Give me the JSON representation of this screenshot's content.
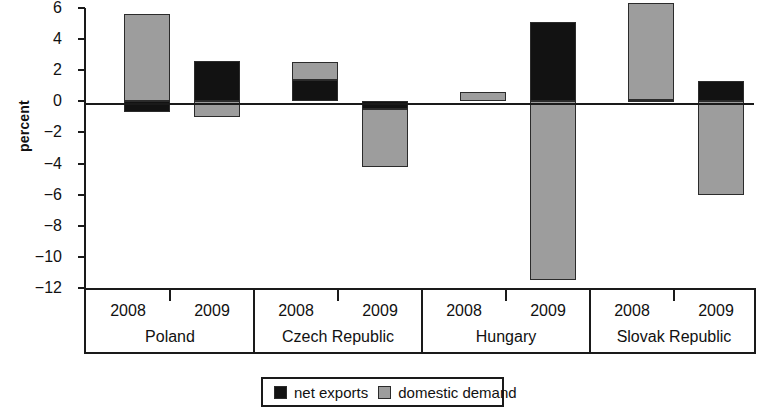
{
  "chart_data": {
    "type": "bar",
    "title": "",
    "subtitle": "",
    "xlabel": "",
    "ylabel": "percent",
    "stacked": true,
    "grid": false,
    "legend_position": "bottom",
    "ylim": [
      -12,
      6
    ],
    "yticks": [
      6,
      4,
      2,
      0,
      -2,
      -4,
      -6,
      -8,
      -10,
      -12
    ],
    "ytick_labels": [
      "6",
      "4",
      "2",
      "0",
      "−2",
      "−4",
      "−6",
      "−8",
      "−10",
      "−12"
    ],
    "groups": [
      "Poland",
      "Czech Republic",
      "Hungary",
      "Slovak Republic"
    ],
    "x": [
      "2008",
      "2009",
      "2008",
      "2009",
      "2008",
      "2009",
      "2008",
      "2009"
    ],
    "series": [
      {
        "name": "net exports",
        "color": "#121212",
        "values": [
          -0.7,
          2.6,
          1.4,
          -0.5,
          0.0,
          5.1,
          0.1,
          1.3
        ]
      },
      {
        "name": "domestic demand",
        "color": "#9d9d9d",
        "values": [
          5.6,
          -1.0,
          1.1,
          -3.7,
          0.6,
          -11.5,
          6.2,
          -6.0
        ]
      }
    ],
    "points": [
      {
        "group": "Poland",
        "year": "2008",
        "net_exports": -0.7,
        "domestic_demand": 5.6
      },
      {
        "group": "Poland",
        "year": "2009",
        "net_exports": 2.6,
        "domestic_demand": -1.0
      },
      {
        "group": "Czech Republic",
        "year": "2008",
        "net_exports": 1.4,
        "domestic_demand": 1.1
      },
      {
        "group": "Czech Republic",
        "year": "2009",
        "net_exports": -0.5,
        "domestic_demand": -3.7
      },
      {
        "group": "Hungary",
        "year": "2008",
        "net_exports": 0.0,
        "domestic_demand": 0.6
      },
      {
        "group": "Hungary",
        "year": "2009",
        "net_exports": 5.1,
        "domestic_demand": -11.5
      },
      {
        "group": "Slovak Republic",
        "year": "2008",
        "net_exports": 0.1,
        "domestic_demand": 6.2
      },
      {
        "group": "Slovak Republic",
        "year": "2009",
        "net_exports": 1.3,
        "domestic_demand": -6.0
      }
    ]
  },
  "axis": {
    "y_title": "percent"
  },
  "legend": {
    "items": [
      {
        "label": "net exports",
        "color": "#121212"
      },
      {
        "label": "domestic demand",
        "color": "#9d9d9d"
      }
    ]
  },
  "categories": [
    {
      "country": "Poland",
      "years": [
        "2008",
        "2009"
      ]
    },
    {
      "country": "Czech Republic",
      "years": [
        "2008",
        "2009"
      ]
    },
    {
      "country": "Hungary",
      "years": [
        "2008",
        "2009"
      ]
    },
    {
      "country": "Slovak Republic",
      "years": [
        "2008",
        "2009"
      ]
    }
  ]
}
